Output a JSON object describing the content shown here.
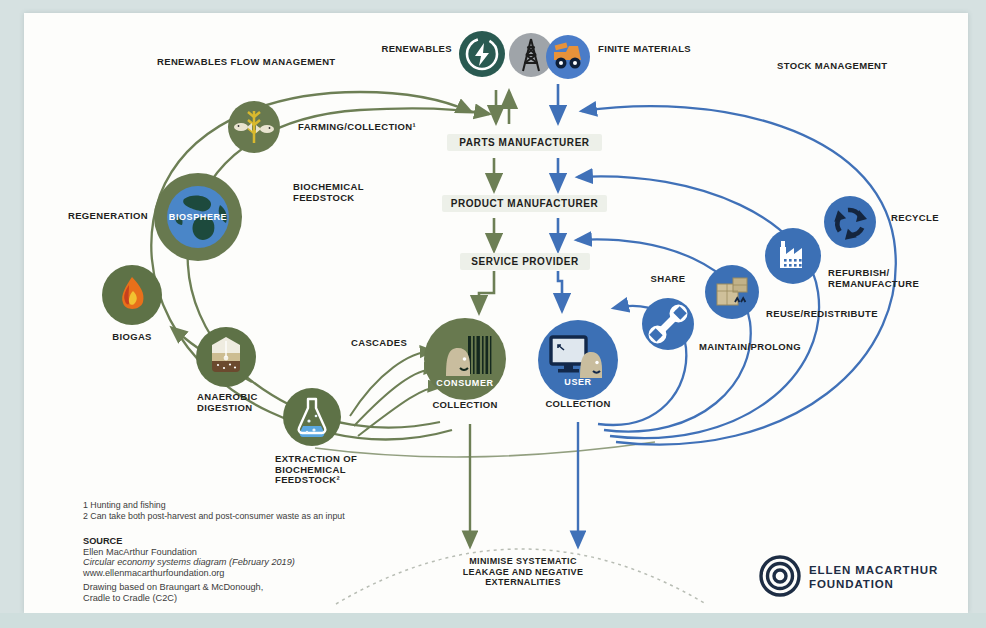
{
  "diagram": {
    "headers": {
      "renewables_flow_management": "RENEWABLES FLOW MANAGEMENT",
      "stock_management": "STOCK MANAGEMENT",
      "renewables": "RENEWABLES",
      "finite_materials": "FINITE MATERIALS"
    },
    "chain": {
      "parts_manufacturer": "PARTS MANUFACTURER",
      "product_manufacturer": "PRODUCT MANUFACTURER",
      "service_provider": "SERVICE PROVIDER"
    },
    "left_cycle": {
      "farming_collection": "FARMING/COLLECTION¹",
      "biochemical_feedstock": "BIOCHEMICAL\nFEEDSTOCK",
      "regeneration": "REGENERATION",
      "biosphere": "BIOSPHERE",
      "biogas": "BIOGAS",
      "anaerobic_digestion": "ANAEROBIC\nDIGESTION",
      "extraction": "EXTRACTION OF\nBIOCHEMICAL\nFEEDSTOCK²",
      "cascades": "CASCADES",
      "consumer": "CONSUMER",
      "collection": "COLLECTION"
    },
    "right_cycle": {
      "user": "USER",
      "collection": "COLLECTION",
      "share": "SHARE",
      "maintain_prolong": "MAINTAIN/PROLONG",
      "reuse_redistribute": "REUSE/REDISTRIBUTE",
      "refurbish_remanufacture": "REFURBISH/\nREMANUFACTURE",
      "recycle": "RECYCLE"
    },
    "bottom": {
      "minimise": "MINIMISE SYSTEMATIC\nLEAKAGE AND NEGATIVE\nEXTERNALITIES"
    },
    "footnotes": {
      "line1": "1 Hunting and fishing",
      "line2": "2 Can take both post-harvest and post-consumer waste as an input"
    },
    "source": {
      "heading": "SOURCE",
      "org": "Ellen MacArthur Foundation",
      "title_italic": "Circular economy systems diagram (February 2019)",
      "url": "www.ellenmacarthurfoundation.org",
      "credit1": "Drawing based on Braungart & McDonough,",
      "credit2": "Cradle to Cradle (C2C)"
    },
    "logo": {
      "line1": "ELLEN MACARTHUR",
      "line2": "FOUNDATION"
    },
    "colors": {
      "green": "#6d7f55",
      "blue": "#4071b8",
      "circle_green": "#68794f",
      "circle_blue": "#3c70b5",
      "teal": "#2a5a51",
      "gray": "#9fa4a9",
      "truck_orange": "#e8923a",
      "navy": "#1d2d44",
      "ink": "#1f1f1d"
    }
  }
}
